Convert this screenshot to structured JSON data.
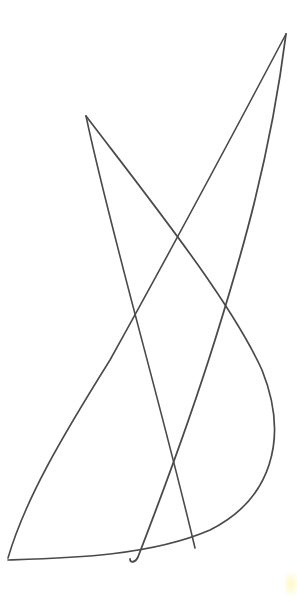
{
  "drawing": {
    "description": "Pencil line sketch of crossing curves on white paper",
    "background": "#ffffff",
    "ink_color": "#4a4a4a",
    "strokes": [
      {
        "name": "left-apex-straight-line",
        "d": "M86,116 C110,230 160,400 195,548",
        "width": 1.6
      },
      {
        "name": "left-apex-big-curve",
        "d": "M86,116 C150,200 230,300 262,370 C290,440 270,500 210,530 C150,556 70,558 8,560",
        "width": 1.7
      },
      {
        "name": "right-apex-long-curve",
        "d": "M286,34 C230,140 160,270 110,360 C60,440 25,500 8,558",
        "width": 1.6
      },
      {
        "name": "right-apex-hook-line",
        "d": "M286,34 C270,160 240,260 215,340 C190,420 160,500 138,557 C135,563 130,563 130,559",
        "width": 1.8
      }
    ],
    "smudge_color": "#fff8be"
  }
}
